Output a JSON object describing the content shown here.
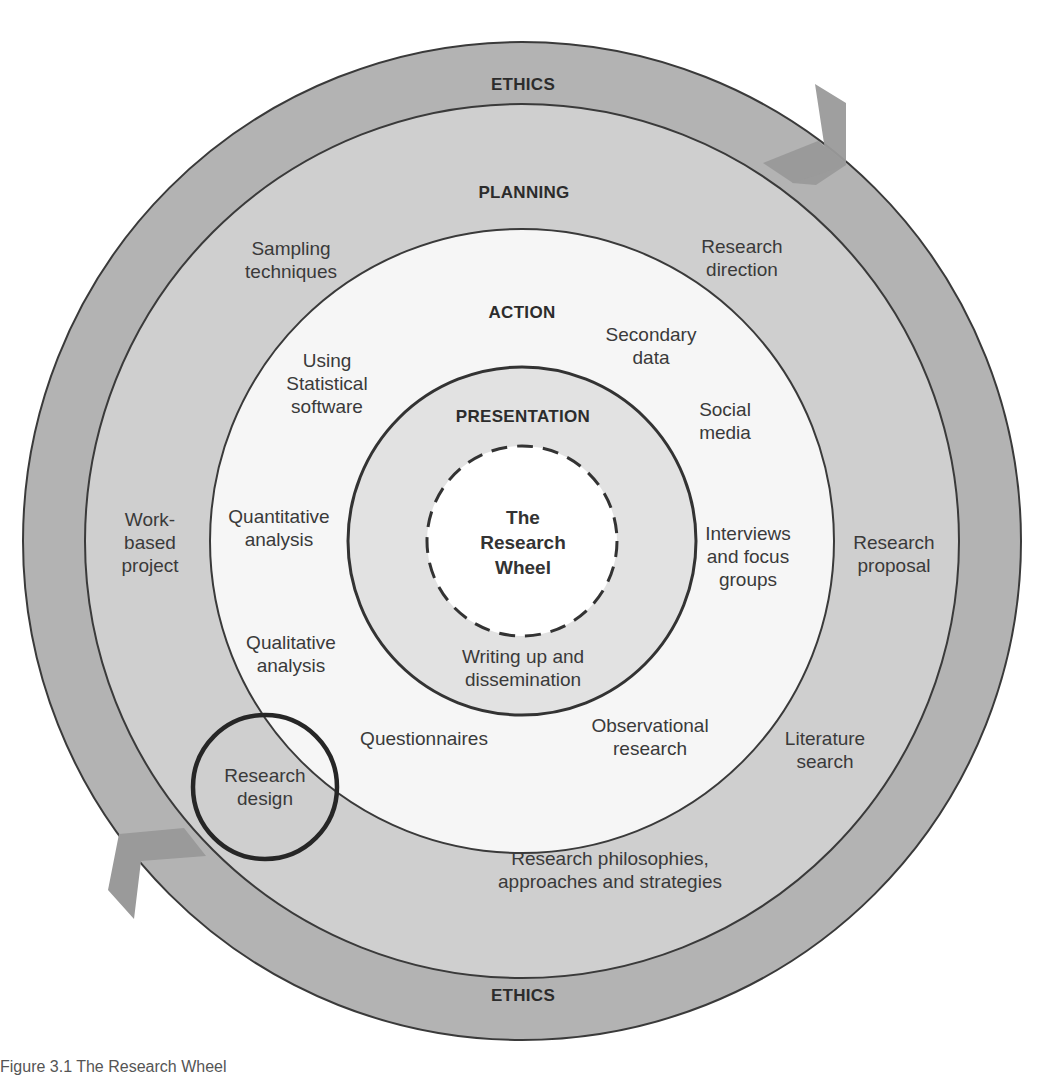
{
  "diagram": {
    "title": "The Research Wheel",
    "center_label": "The\nResearch\nWheel",
    "colors": {
      "ethics_ring": "#b3b3b3",
      "planning_ring": "#cfcfcf",
      "action_ring": "#f6f6f6",
      "presentation_ring": "#e2e2e2",
      "core": "#ffffff",
      "arrow": "#9a9a9a",
      "stroke": "#3a3a3a"
    },
    "rings": {
      "ethics": {
        "label_top": "ETHICS",
        "label_bottom": "ETHICS"
      },
      "planning": {
        "label": "PLANNING",
        "items": [
          "Sampling\ntechniques",
          "Research\ndirection",
          "Work-\nbased\nproject",
          "Research\nproposal",
          "Research\ndesign",
          "Literature\nsearch",
          "Research philosophies,\napproaches and strategies"
        ]
      },
      "action": {
        "label": "ACTION",
        "items": [
          "Secondary\ndata",
          "Using\nStatistical\nsoftware",
          "Social\nmedia",
          "Quantitative\nanalysis",
          "Interviews\nand focus\ngroups",
          "Qualitative\nanalysis",
          "Questionnaires",
          "Observational\nresearch"
        ]
      },
      "presentation": {
        "label": "PRESENTATION",
        "items": [
          "Writing up and\ndissemination"
        ]
      }
    },
    "highlighted_item": "Research\ndesign",
    "caption": "Figure 3.1  The Research Wheel"
  }
}
